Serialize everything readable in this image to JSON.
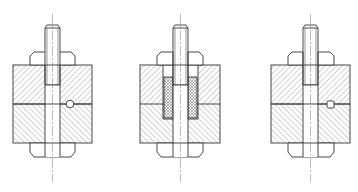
{
  "diagram": {
    "type": "technical-drawing",
    "colors": {
      "line": "#333333",
      "hatch": "#555555",
      "background": "#ffffff"
    },
    "figures": [
      {
        "id": "fig-1",
        "locator": "round-pin",
        "locator_shape": "circle",
        "sleeve": false
      },
      {
        "id": "fig-2",
        "locator": "sleeve",
        "locator_shape": "cross-hatched-bushing",
        "sleeve": true
      },
      {
        "id": "fig-3",
        "locator": "square-key",
        "locator_shape": "square",
        "sleeve": false
      }
    ]
  }
}
